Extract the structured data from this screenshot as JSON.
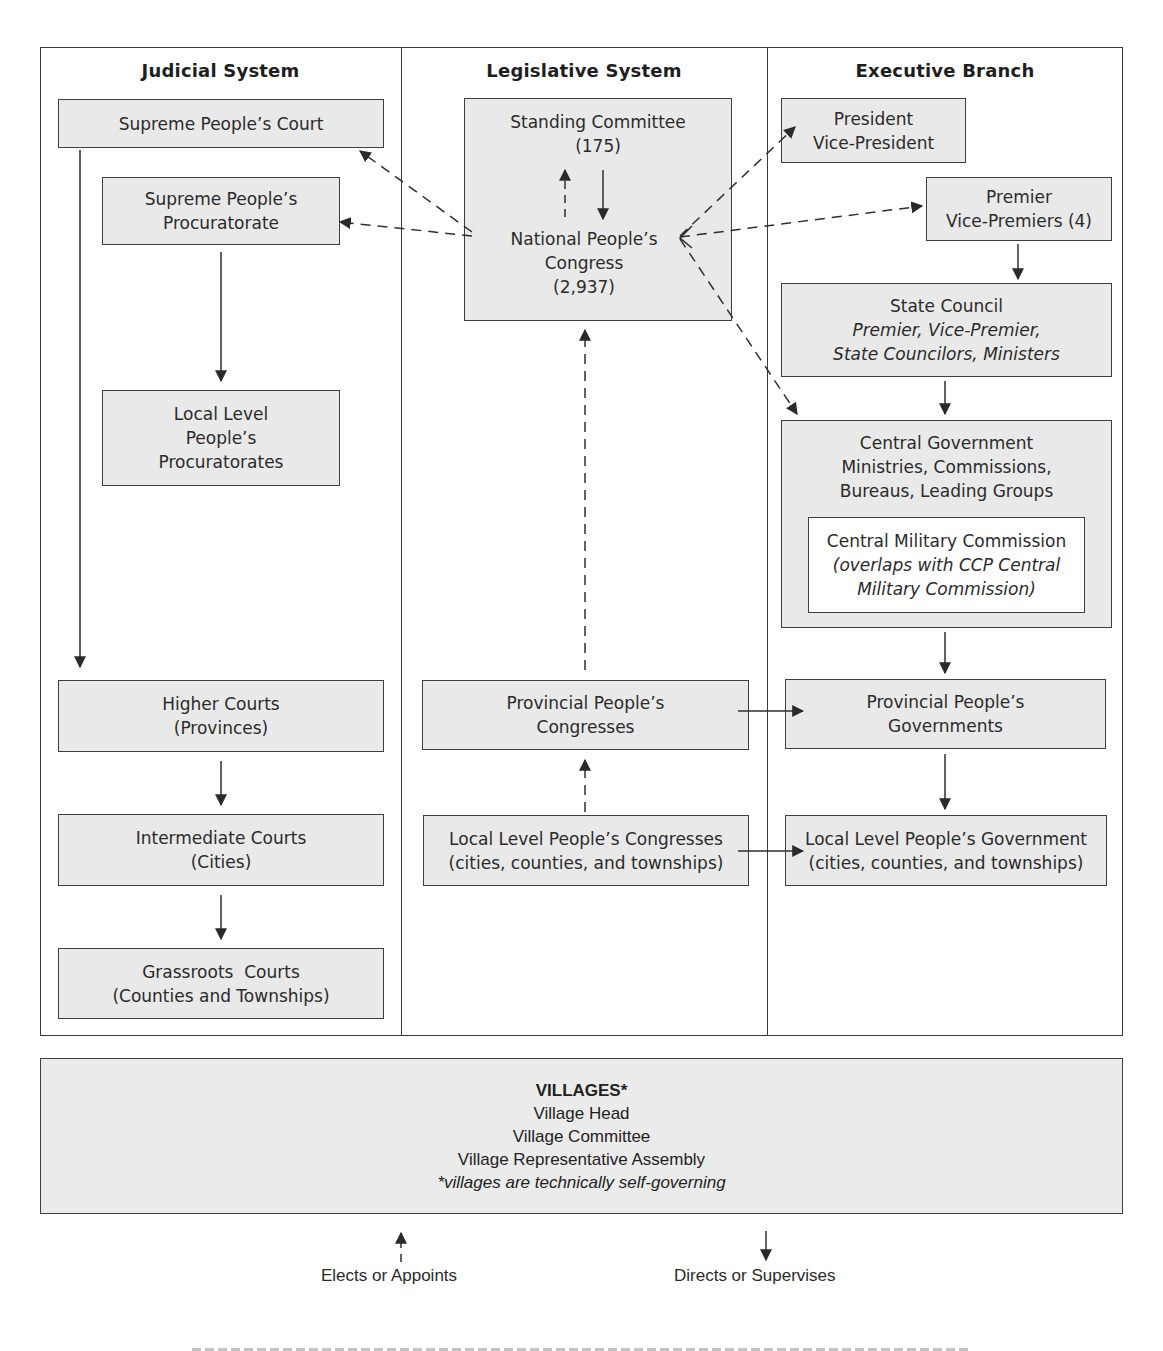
{
  "diagram": {
    "columns": [
      {
        "id": "judicial",
        "title": "Judicial System"
      },
      {
        "id": "legislative",
        "title": "Legislative System"
      },
      {
        "id": "executive",
        "title": "Executive Branch"
      }
    ],
    "judicial": {
      "supreme_court": {
        "lines": [
          "Supreme People’s Court"
        ]
      },
      "supreme_procuratorate": {
        "lines": [
          "Supreme People’s",
          "Procuratorate"
        ]
      },
      "local_procuratorates": {
        "lines": [
          "Local Level",
          "People’s",
          "Procuratorates"
        ]
      },
      "higher_courts": {
        "lines": [
          "Higher Courts",
          "(Provinces)"
        ]
      },
      "intermediate_courts": {
        "lines": [
          "Intermediate Courts",
          "(Cities)"
        ]
      },
      "grassroots_courts": {
        "lines": [
          "Grassroots  Courts",
          "(Counties and Townships)"
        ]
      }
    },
    "legislative": {
      "standing_committee": {
        "lines": [
          "Standing Committee",
          "(175)"
        ]
      },
      "npc": {
        "lines": [
          "National People’s",
          "Congress",
          "(2,937)"
        ]
      },
      "provincial_congresses": {
        "lines": [
          "Provincial People’s",
          "Congresses"
        ]
      },
      "local_congresses": {
        "lines": [
          "Local Level People’s Congresses",
          "(cities, counties, and townships)"
        ]
      }
    },
    "executive": {
      "president": {
        "lines": [
          "President",
          "Vice-President"
        ]
      },
      "premier": {
        "lines": [
          "Premier",
          "Vice-Premiers (4)"
        ]
      },
      "state_council": {
        "title": "State Council",
        "italic_lines": [
          "Premier, Vice-Premier,",
          "State Councilors, Ministers"
        ]
      },
      "central_government": {
        "lines": [
          "Central Government",
          "Ministries, Commissions,",
          "Bureaus, Leading Groups"
        ]
      },
      "central_military_commission": {
        "title": "Central Military Commission",
        "italic_lines": [
          "(overlaps with CCP Central",
          "Military Commission)"
        ]
      },
      "provincial_governments": {
        "lines": [
          "Provincial People’s",
          "Governments"
        ]
      },
      "local_government": {
        "lines": [
          "Local Level People’s Government",
          "(cities, counties, and townships)"
        ]
      }
    },
    "villages": {
      "title": "VILLAGES*",
      "lines": [
        "Village Head",
        "Village Committee",
        "Village Representative Assembly"
      ],
      "note": "*villages are technically self-governing"
    },
    "legend": {
      "dashed": "Elects or Appoints",
      "solid": "Directs or Supervises"
    },
    "colors": {
      "box_fill": "#e9e9e9",
      "inner_box_fill": "#ffffff",
      "line": "#3a3a3a",
      "text": "#2b2b2b"
    }
  }
}
